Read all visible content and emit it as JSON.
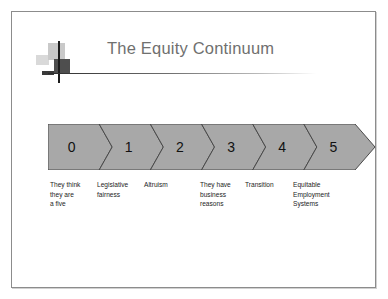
{
  "slide": {
    "title": "The Equity Continuum",
    "decoration_icon": "crosshair-decoration-icon",
    "background_color": "#ffffff",
    "border_color": "#8c8c8c",
    "title_color": "#70706f"
  },
  "chart_data": {
    "type": "bar",
    "title": "The Equity Continuum",
    "xlabel": "",
    "ylabel": "",
    "orientation": "horizontal-chevron-process",
    "band_color": "#a8a8a8",
    "band_stroke": "#4a4a4a",
    "categories": [
      "0",
      "1",
      "2",
      "3",
      "4",
      "5"
    ],
    "values": [
      0,
      1,
      2,
      3,
      4,
      5
    ],
    "stage_labels": [
      "They think they are a five",
      "Legislative fairness",
      "Altruism",
      "They have business reasons",
      "Transition",
      "Equitable Employment Systems"
    ],
    "legend": [],
    "grid": false,
    "annotations": []
  },
  "continuum": {
    "stages": [
      {
        "number": "0",
        "caption_lines": [
          "They think",
          "they are",
          "a five"
        ],
        "caption_left": 2,
        "caption_width": 46
      },
      {
        "number": "1",
        "caption_lines": [
          "Legislative",
          "fairness"
        ],
        "caption_left": 49,
        "caption_width": 46
      },
      {
        "number": "2",
        "caption_lines": [
          "Altruism"
        ],
        "caption_left": 96,
        "caption_width": 48
      },
      {
        "number": "3",
        "caption_lines": [
          "They have",
          "business",
          "reasons"
        ],
        "caption_left": 152,
        "caption_width": 46
      },
      {
        "number": "4",
        "caption_lines": [
          "Transition"
        ],
        "caption_left": 197,
        "caption_width": 46
      },
      {
        "number": "5",
        "caption_lines": [
          "Equitable",
          "Employment",
          "Systems"
        ],
        "caption_left": 245,
        "caption_width": 60
      }
    ]
  }
}
